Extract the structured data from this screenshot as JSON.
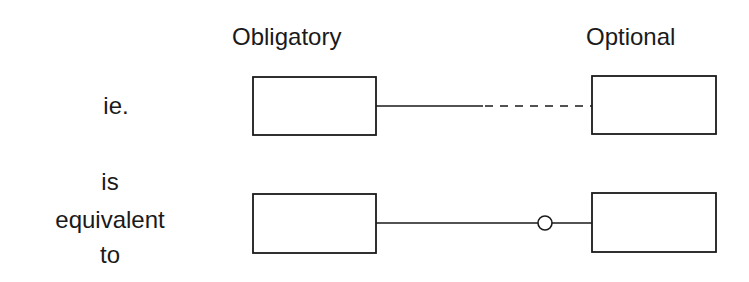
{
  "diagram": {
    "column_headers": {
      "obligatory": "Obligatory",
      "optional": "Optional"
    },
    "rows": [
      {
        "label_lines": [
          "ie."
        ],
        "left_entity": "",
        "right_entity": "",
        "connector": {
          "left_segment": "solid",
          "right_segment": "dashed",
          "optional_marker": "none"
        }
      },
      {
        "label_lines": [
          "is",
          "equivalent",
          "to"
        ],
        "left_entity": "",
        "right_entity": "",
        "connector": {
          "left_segment": "solid",
          "right_segment": "solid",
          "optional_marker": "circle"
        }
      }
    ]
  }
}
